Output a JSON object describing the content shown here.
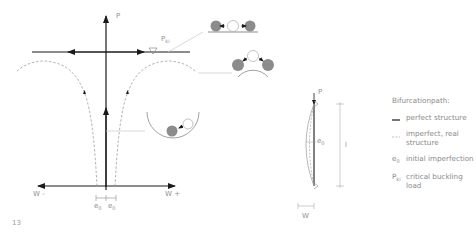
{
  "figure_number": "13",
  "main_diagram": {
    "axis_labels": {
      "load": "P",
      "critical_load": "P",
      "critical_load_sub": "ki",
      "deflection_negative": "W -",
      "deflection_positive": "W +",
      "imperfection_left": "e",
      "imperfection_right": "e",
      "imperfection_sub": "0"
    },
    "stability_illustrations": [
      {
        "name": "neutral-equilibrium",
        "description": "ball on flat surface"
      },
      {
        "name": "unstable-equilibrium",
        "description": "ball on convex surface"
      },
      {
        "name": "stable-equilibrium",
        "description": "ball in concave bowl"
      }
    ]
  },
  "column_diagram": {
    "load_label": "P",
    "imperfection_label": "e",
    "imperfection_sub": "0",
    "length_label": "l",
    "deflection_label": "W"
  },
  "legend": {
    "title": "Bifurcationpath:",
    "items": [
      {
        "symbol": "solid-line",
        "label": "perfect structure"
      },
      {
        "symbol": "dashed-line",
        "label": "imperfect, real structure"
      },
      {
        "symbol": "e0",
        "symbol_text": "e",
        "symbol_sub": "0",
        "label": "initial imperfection"
      },
      {
        "symbol": "Pki",
        "symbol_text": "P",
        "symbol_sub": "ki",
        "label": "critical buckling load"
      }
    ]
  },
  "colors": {
    "line_dark": "#1a1a1a",
    "line_gray": "#9a9a9a",
    "ball_fill": "#8c8c8c",
    "text": "#8a8a8a"
  }
}
